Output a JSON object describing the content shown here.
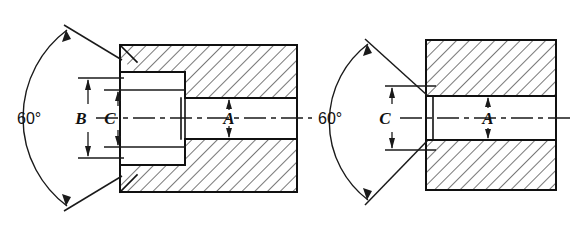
{
  "figure": {
    "type": "engineering-drawing",
    "background_color": "#ffffff",
    "line_color": "#101010",
    "views": [
      {
        "id": "left-view",
        "name": "counterbored-bushing-section",
        "angle_dimension": "60°",
        "diameter_dimensions": [
          "B",
          "C",
          "A"
        ]
      },
      {
        "id": "right-view",
        "name": "straight-bushing-section",
        "angle_dimension": "60°",
        "diameter_dimensions": [
          "C",
          "A"
        ]
      }
    ]
  },
  "labels": {
    "left_angle": "60°",
    "left_dim_b": "B",
    "left_dim_c": "C",
    "left_dim_a": "A",
    "right_angle": "60°",
    "right_dim_c": "C",
    "right_dim_a": "A"
  }
}
